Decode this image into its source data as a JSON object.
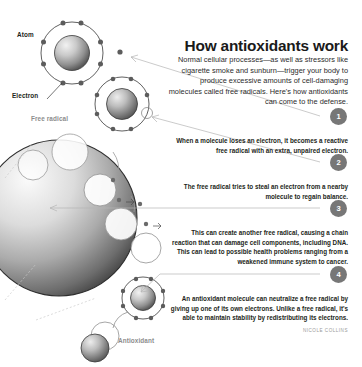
{
  "headline": "How antioxidants work",
  "intro": "Normal cellular processes—as well as stressors like cigarette smoke and sunburn—trigger your body to produce excessive amounts of cell-damaging molecules called free radicals. Here's how antioxidants can come to the defense.",
  "steps": [
    {
      "number": "1",
      "text": "When a molecule loses an electron, it becomes a reactive free radical with an extra, unpaired electron."
    },
    {
      "number": "2",
      "text": "The free radical tries to steal an electron from a nearby molecule to regain balance."
    },
    {
      "number": "3",
      "text": "This can create another free radical, causing a chain reaction that can damage cell components, including DNA. This can lead to possible health problems ranging from a weakened immune system to cancer."
    },
    {
      "number": "4",
      "text": "An antioxidant molecule can neutralize a free radical by giving up one of its own electrons. Unlike a free radical, it's able to maintain stability by redistributing its electrons."
    }
  ],
  "diagram_labels": {
    "atom": "Atom",
    "electron": "Electron",
    "free_radical": "Free radical",
    "antioxidant": "Antioxidant"
  },
  "credit": "NICOLE COLLINS",
  "colors": {
    "badge_background": "#777777",
    "badge_text": "#ffffff",
    "headline_text": "#1a1a1a",
    "body_text": "#231f20",
    "muted_label": "#8d8d8d",
    "connector_line": "#b4b4b4",
    "nucleus_dark": "#4a4a4a",
    "nucleus_light": "#e8e8e8",
    "page_background": "#ffffff"
  }
}
